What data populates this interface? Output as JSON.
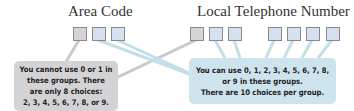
{
  "area_code": {
    "label": "Area Code",
    "boxes": [
      "gray",
      "blue",
      "blue"
    ]
  },
  "local_number": {
    "label": "Local Telephone Number",
    "boxes": [
      "gray",
      "blue",
      "blue",
      "blue",
      "blue",
      "blue",
      "blue"
    ]
  },
  "callouts": {
    "restricted": {
      "lines": [
        "You cannot use 0 or 1 in",
        "these groups. There",
        "are only 8 choices:",
        "2, 3, 4, 5, 6, 7, 8, or 9."
      ]
    },
    "unrestricted": {
      "lines": [
        "You can use 0, 1, 2, 3, 4, 5, 6, 7, 8,",
        "or 9 in these groups.",
        "There are 10 choices per group."
      ]
    }
  },
  "colors": {
    "gray_box": "#d6d4d6",
    "blue_box": "#d5e1f0",
    "gray_callout": "#d3d3d5",
    "blue_callout": "#cde3ee",
    "gray_line": "#c9c9cc",
    "blue_line": "#c2dfe9"
  }
}
